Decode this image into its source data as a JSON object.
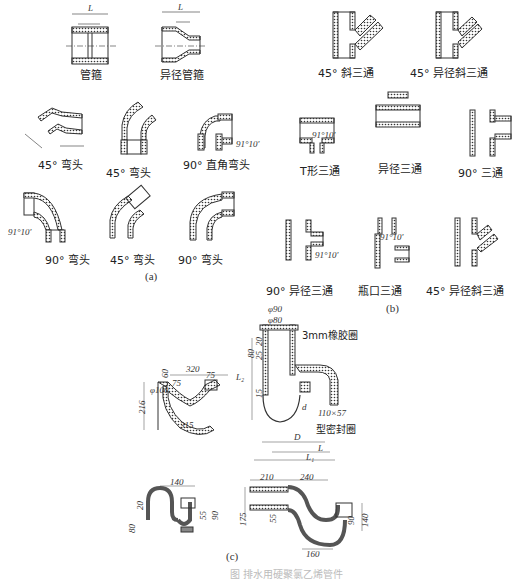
{
  "figure": {
    "caption": "图 排水用硬聚氯乙烯管件",
    "panels": {
      "a": {
        "label": "(a)",
        "items": [
          {
            "name": "管箍"
          },
          {
            "name": "异径管箍"
          },
          {
            "name": "45° 弯头"
          },
          {
            "name": "45° 弯头"
          },
          {
            "name": "90° 直角弯头"
          },
          {
            "name": "90° 弯头"
          },
          {
            "name": "45° 弯头"
          },
          {
            "name": "90° 弯头"
          }
        ],
        "dims": {
          "L": "L",
          "Z": "Z",
          "angle": "91°10′"
        }
      },
      "b": {
        "label": "(b)",
        "items": [
          {
            "name": "45° 斜三通"
          },
          {
            "name": "45° 异径斜三通"
          },
          {
            "name": "T形三通"
          },
          {
            "name": "异径三通"
          },
          {
            "name": "90° 三通"
          },
          {
            "name": "90° 异径三通"
          },
          {
            "name": "瓶口三通"
          },
          {
            "name": "45° 异径斜三通"
          }
        ],
        "dims": {
          "L1": "L₁",
          "L2": "L₂",
          "L3": "L₃",
          "Z1": "Z₁",
          "Z2": "Z₂",
          "Z3": "Z₃",
          "angle": "91°10′"
        }
      },
      "c": {
        "label": "(c)",
        "s_trap": {
          "width": "320",
          "height": "216",
          "dia": "φ100",
          "d60": "60",
          "d75a": "75",
          "d75b": "75",
          "diag": "315"
        },
        "floor_drain": {
          "phi90": "φ90",
          "phi80": "φ80",
          "ring": "3mm橡胶圈",
          "d80": "80",
          "d20": "20",
          "d25": "25",
          "d15": "15",
          "seal": "110×57",
          "seal2": "型密封圈",
          "L": "L",
          "L1": "L₁",
          "L2": "L₂",
          "D": "D",
          "d": "d"
        },
        "p_trap_small": {
          "width": "140",
          "d20": "20",
          "d80": "80",
          "d55": "55",
          "d90": "90"
        },
        "p_trap_large": {
          "d210": "210",
          "d240": "240",
          "d175": "175",
          "d55": "55",
          "d90": "90",
          "d140": "140",
          "d160": "160"
        }
      }
    }
  }
}
